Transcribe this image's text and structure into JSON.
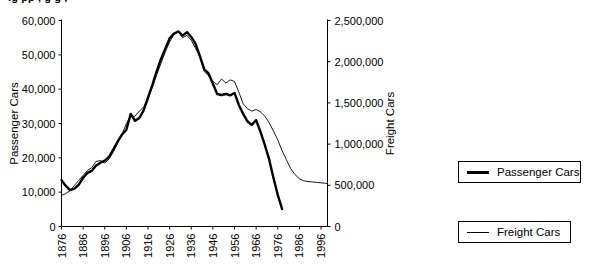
{
  "title_partial": "ig             pp      ,    g            g        ,",
  "legend": {
    "passenger": {
      "label": "Passenger Cars",
      "swatch": "thick-line-swatch"
    },
    "freight": {
      "label": "Freight Cars",
      "swatch": "thin-line-swatch"
    }
  },
  "chart_data": {
    "type": "line",
    "title": "",
    "xlabel": "",
    "grid": false,
    "legend_position": "right",
    "x": [
      1876,
      1878,
      1880,
      1882,
      1884,
      1886,
      1888,
      1890,
      1892,
      1894,
      1896,
      1898,
      1900,
      1902,
      1904,
      1906,
      1908,
      1910,
      1912,
      1914,
      1916,
      1918,
      1920,
      1922,
      1924,
      1926,
      1928,
      1930,
      1932,
      1934,
      1936,
      1938,
      1940,
      1942,
      1944,
      1946,
      1948,
      1950,
      1952,
      1954,
      1956,
      1958,
      1960,
      1962,
      1964,
      1966,
      1968,
      1970,
      1972,
      1974,
      1976,
      1978,
      1980,
      1982,
      1984,
      1986,
      1988,
      1990,
      1992,
      1994,
      1996,
      1998,
      1999
    ],
    "axes": {
      "left": {
        "label": "Passenger Cars",
        "ticks": [
          "0",
          "10,000",
          "20,000",
          "30,000",
          "40,000",
          "50,000",
          "60,000"
        ],
        "tick_values": [
          0,
          10000,
          20000,
          30000,
          40000,
          50000,
          60000
        ],
        "lim": [
          0,
          60000
        ]
      },
      "right": {
        "label": "Freight Cars",
        "ticks": [
          "0",
          "500,000",
          "1,000,000",
          "1,500,000",
          "2,000,000",
          "2,500,000"
        ],
        "tick_values": [
          0,
          500000,
          1000000,
          1500000,
          2000000,
          2500000
        ],
        "lim": [
          0,
          2500000
        ]
      },
      "bottom": {
        "ticks": [
          "1876",
          "1886",
          "1896",
          "1906",
          "1916",
          "1926",
          "1936",
          "1946",
          "1956",
          "1966",
          "1976",
          "1986",
          "1996"
        ],
        "tick_values": [
          1876,
          1886,
          1896,
          1906,
          1916,
          1926,
          1936,
          1946,
          1956,
          1966,
          1976,
          1986,
          1996
        ],
        "lim": [
          1876,
          1999
        ],
        "tick_rotation": -90
      }
    },
    "series": [
      {
        "name": "Passenger Cars",
        "axis": "left",
        "line_width": 2.4,
        "color": "#000000",
        "values": [
          13500,
          11800,
          10600,
          11000,
          12200,
          14200,
          15600,
          16200,
          17800,
          18600,
          19200,
          20300,
          22500,
          24800,
          26800,
          28200,
          32800,
          30800,
          31600,
          33800,
          37500,
          41200,
          45200,
          48800,
          51800,
          54800,
          56200,
          56800,
          55600,
          56600,
          55200,
          53200,
          49600,
          45800,
          44600,
          41600,
          38600,
          38300,
          38600,
          38200,
          38900,
          35400,
          32800,
          30600,
          29600,
          31000,
          27600,
          23800,
          19600,
          14200,
          9200,
          5100,
          null,
          null,
          null,
          null,
          null,
          null,
          null,
          null,
          null,
          null,
          null
        ]
      },
      {
        "name": "Freight Cars",
        "axis": "right",
        "line_width": 0.9,
        "color": "#000000",
        "values": [
          380000,
          400000,
          435000,
          500000,
          560000,
          620000,
          680000,
          715000,
          790000,
          800000,
          770000,
          820000,
          905000,
          1010000,
          1120000,
          1250000,
          1330000,
          1340000,
          1400000,
          1450000,
          1560000,
          1690000,
          1840000,
          1980000,
          2120000,
          2240000,
          2330000,
          2370000,
          2290000,
          2320000,
          2260000,
          2160000,
          2060000,
          1880000,
          1830000,
          1760000,
          1720000,
          1790000,
          1740000,
          1780000,
          1760000,
          1630000,
          1490000,
          1430000,
          1400000,
          1420000,
          1390000,
          1340000,
          1260000,
          1160000,
          1050000,
          920000,
          810000,
          700000,
          630000,
          580000,
          555000,
          545000,
          540000,
          535000,
          530000,
          525000,
          520000
        ]
      }
    ]
  }
}
